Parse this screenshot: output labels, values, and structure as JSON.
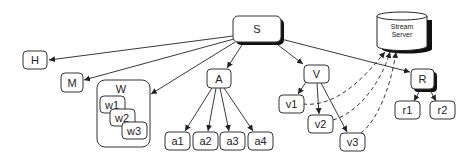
{
  "diagram": {
    "nodes": {
      "S": "S",
      "H": "H",
      "M": "M",
      "W": "W",
      "w1": "w1",
      "w2": "w2",
      "w3": "w3",
      "A": "A",
      "a1": "a1",
      "a2": "a2",
      "a3": "a3",
      "a4": "a4",
      "V": "V",
      "v1": "v1",
      "v2": "v2",
      "v3": "v3",
      "R": "R",
      "r1": "r1",
      "r2": "r2",
      "stream_line1": "Stream",
      "stream_line2": "Server"
    },
    "edges": [
      {
        "from": "S",
        "to": "H",
        "style": "solid"
      },
      {
        "from": "S",
        "to": "M",
        "style": "solid"
      },
      {
        "from": "S",
        "to": "W",
        "style": "solid"
      },
      {
        "from": "S",
        "to": "A",
        "style": "solid"
      },
      {
        "from": "S",
        "to": "V",
        "style": "solid"
      },
      {
        "from": "S",
        "to": "R",
        "style": "solid"
      },
      {
        "from": "A",
        "to": "a1",
        "style": "solid"
      },
      {
        "from": "A",
        "to": "a2",
        "style": "solid"
      },
      {
        "from": "A",
        "to": "a3",
        "style": "solid"
      },
      {
        "from": "A",
        "to": "a4",
        "style": "solid"
      },
      {
        "from": "V",
        "to": "v1",
        "style": "solid"
      },
      {
        "from": "V",
        "to": "v2",
        "style": "solid"
      },
      {
        "from": "V",
        "to": "v3",
        "style": "solid"
      },
      {
        "from": "R",
        "to": "r1",
        "style": "solid"
      },
      {
        "from": "R",
        "to": "r2",
        "style": "solid"
      },
      {
        "from": "v1",
        "to": "Stream Server",
        "style": "dashed"
      },
      {
        "from": "v2",
        "to": "Stream Server",
        "style": "dashed"
      },
      {
        "from": "v3",
        "to": "Stream Server",
        "style": "dashed"
      }
    ]
  }
}
